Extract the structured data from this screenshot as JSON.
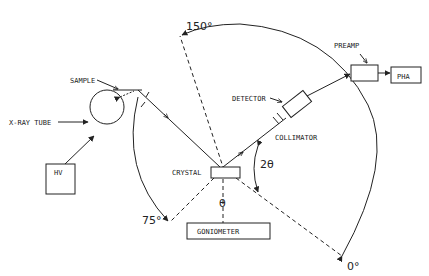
{
  "diagram": {
    "labels": {
      "sample": "SAMPLE",
      "xray_tube": "X-RAY TUBE",
      "hv": "HV",
      "crystal": "CRYSTAL",
      "goniometer": "GONIOMETER",
      "detector": "DETECTOR",
      "collimator": "COLLIMATOR",
      "preamp": "PREAMP",
      "pha": "PHA"
    },
    "angles": {
      "a150": "150°",
      "a75": "75°",
      "a0": "0°",
      "two_theta": "2θ",
      "theta": "θ"
    },
    "colors": {
      "ink": "#222222",
      "background": "#ffffff"
    }
  }
}
